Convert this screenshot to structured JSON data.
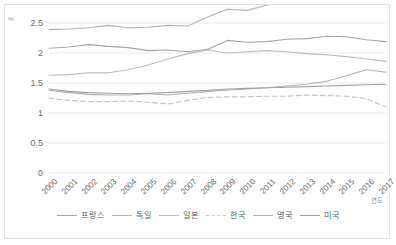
{
  "chart_data": {
    "type": "line",
    "title": "",
    "xlabel": "연도",
    "ylabel": "%",
    "ylim": [
      0,
      2.5
    ],
    "ytick_labels": [
      "2.5",
      "2",
      "1.5",
      "1",
      "0.5",
      "0"
    ],
    "ytick_values": [
      2.5,
      2,
      1.5,
      1,
      0.5,
      0
    ],
    "grid": true,
    "legend_position": "bottom",
    "categories": [
      "2000",
      "2001",
      "2002",
      "2003",
      "2004",
      "2005",
      "2006",
      "2007",
      "2008",
      "2009",
      "2010",
      "2011",
      "2012",
      "2013",
      "2014",
      "2015",
      "2016",
      "2017"
    ],
    "series": [
      {
        "name": "프랑스",
        "color": "#a6a6a6",
        "dash": "solid",
        "values": [
          2.08,
          2.1,
          2.14,
          2.11,
          2.09,
          2.04,
          2.05,
          2.02,
          2.06,
          2.21,
          2.18,
          2.19,
          2.23,
          2.24,
          2.28,
          2.27,
          2.22,
          2.19
        ]
      },
      {
        "name": "독일",
        "color": "#b3b3b3",
        "dash": "solid",
        "values": [
          2.39,
          2.4,
          2.42,
          2.46,
          2.42,
          2.43,
          2.46,
          2.45,
          2.6,
          2.73,
          2.71,
          2.8,
          2.87,
          2.82,
          2.87,
          2.92,
          2.94,
          3.02
        ]
      },
      {
        "name": "일본",
        "color": "#bcbcbc",
        "dash": "solid",
        "values": [
          1.63,
          1.64,
          1.67,
          1.67,
          1.72,
          1.8,
          1.9,
          1.99,
          2.05,
          2.0,
          2.02,
          2.04,
          2.02,
          1.99,
          1.97,
          1.94,
          1.9,
          1.86
        ]
      },
      {
        "name": "한국",
        "color": "#c4c4c4",
        "dash": "dashed",
        "values": [
          1.25,
          1.21,
          1.19,
          1.19,
          1.2,
          1.18,
          1.15,
          1.21,
          1.26,
          1.27,
          1.27,
          1.28,
          1.28,
          1.3,
          1.29,
          1.28,
          1.24,
          1.1
        ]
      },
      {
        "name": "영국",
        "color": "#b0b0b0",
        "dash": "solid",
        "values": [
          1.38,
          1.34,
          1.31,
          1.3,
          1.3,
          1.32,
          1.3,
          1.33,
          1.36,
          1.38,
          1.4,
          1.42,
          1.45,
          1.48,
          1.53,
          1.62,
          1.72,
          1.68
        ]
      },
      {
        "name": "미국",
        "color": "#a0a0a0",
        "dash": "solid",
        "values": [
          1.4,
          1.36,
          1.34,
          1.33,
          1.32,
          1.33,
          1.34,
          1.36,
          1.38,
          1.4,
          1.41,
          1.42,
          1.43,
          1.44,
          1.45,
          1.46,
          1.47,
          1.48
        ]
      }
    ]
  },
  "axes": {
    "y_unit": "%",
    "x_title": "연도"
  }
}
